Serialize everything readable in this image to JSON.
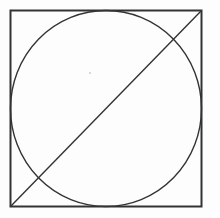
{
  "diagram": {
    "shapes": [
      "square",
      "inscribed-circle",
      "diagonal"
    ],
    "stroke_color": "#333333",
    "background_color": "#fdfdfd",
    "diagonal_direction": "bottom-left to top-right"
  }
}
